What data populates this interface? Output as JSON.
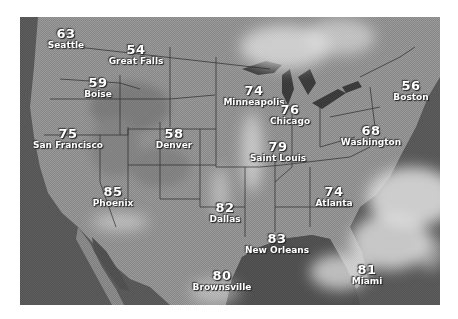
{
  "map": {
    "title": "US satellite weather map with city temperatures",
    "colors": {
      "ocean": "#5e5e5e",
      "land": "#9a9a9a",
      "clouds": "#e2e2e2",
      "borders": "#2a2a2a",
      "label": "#ffffff"
    },
    "cities": [
      {
        "name": "Seattle",
        "temp": "63"
      },
      {
        "name": "Great Falls",
        "temp": "54"
      },
      {
        "name": "Boise",
        "temp": "59"
      },
      {
        "name": "San Francisco",
        "temp": "75"
      },
      {
        "name": "Denver",
        "temp": "58"
      },
      {
        "name": "Minneapolis",
        "temp": "74"
      },
      {
        "name": "Chicago",
        "temp": "76"
      },
      {
        "name": "Saint Louis",
        "temp": "79"
      },
      {
        "name": "Boston",
        "temp": "56"
      },
      {
        "name": "Washington",
        "temp": "68"
      },
      {
        "name": "Phoenix",
        "temp": "85"
      },
      {
        "name": "Dallas",
        "temp": "82"
      },
      {
        "name": "Atlanta",
        "temp": "74"
      },
      {
        "name": "New Orleans",
        "temp": "83"
      },
      {
        "name": "Brownsville",
        "temp": "80"
      },
      {
        "name": "Miami",
        "temp": "81"
      }
    ]
  }
}
